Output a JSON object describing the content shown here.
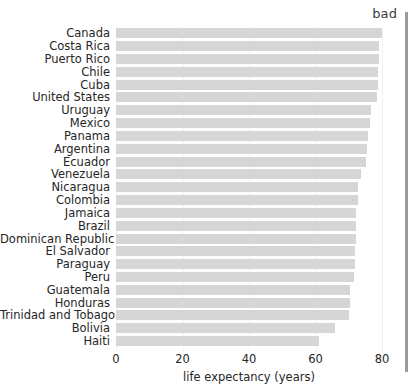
{
  "annotation": {
    "bad_label": "bad"
  },
  "chart_data": {
    "type": "bar",
    "orientation": "horizontal",
    "title": "",
    "subtitle": "",
    "xlabel": "life expectancy (years)",
    "ylabel": "",
    "xlim": [
      0,
      80
    ],
    "xticks": [
      0,
      20,
      40,
      60,
      80
    ],
    "xtick_labels": [
      "0",
      "20",
      "40",
      "60",
      "80"
    ],
    "grid": true,
    "legend": null,
    "bar_color": "#d6d6d6",
    "annotation_rule_color": "#9a9a9a",
    "categories": [
      "Canada",
      "Costa Rica",
      "Puerto Rico",
      "Chile",
      "Cuba",
      "United States",
      "Uruguay",
      "Mexico",
      "Panama",
      "Argentina",
      "Ecuador",
      "Venezuela",
      "Nicaragua",
      "Colombia",
      "Jamaica",
      "Brazil",
      "Dominican Republic",
      "El Salvador",
      "Paraguay",
      "Peru",
      "Guatemala",
      "Honduras",
      "Trinidad and Tobago",
      "Bolivia",
      "Haiti"
    ],
    "values": [
      80.0,
      79.1,
      79.0,
      78.9,
      78.7,
      78.5,
      76.7,
      76.3,
      75.8,
      75.6,
      75.2,
      73.8,
      72.9,
      72.8,
      72.3,
      72.2,
      72.1,
      71.9,
      71.8,
      71.5,
      70.5,
      70.3,
      70.0,
      66.0,
      61.2
    ]
  }
}
